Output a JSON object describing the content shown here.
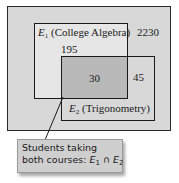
{
  "diagram": {
    "type": "venn",
    "universe_count": "2230",
    "sets": [
      {
        "symbol": "E",
        "subscript": "1",
        "name": "(College Algebra)",
        "only_count": "195"
      },
      {
        "symbol": "E",
        "subscript": "2",
        "name": "(Trigonometry)",
        "only_count": "45"
      }
    ],
    "intersection_count": "30",
    "callout": {
      "line1": "Students taking",
      "line2_prefix": "both courses: ",
      "set_a": "E",
      "set_a_sub": "1",
      "operator": "∩",
      "set_b": "E",
      "set_b_sub": "2"
    },
    "colors": {
      "universe": "#d8d8d8",
      "e1_only": "#e6e6e6",
      "intersection": "#b9b9b9",
      "callout_bg": "#cfcfcf",
      "stroke": "#1a1a1a"
    }
  }
}
